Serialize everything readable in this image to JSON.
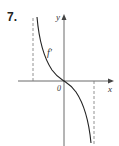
{
  "problem_number": "7.",
  "labels": {
    "y_axis": "y",
    "x_axis": "x",
    "origin": "0",
    "function": "f′"
  },
  "colors": {
    "curve": "#222222",
    "axes": "#444444",
    "asymptote": "#666666"
  }
}
